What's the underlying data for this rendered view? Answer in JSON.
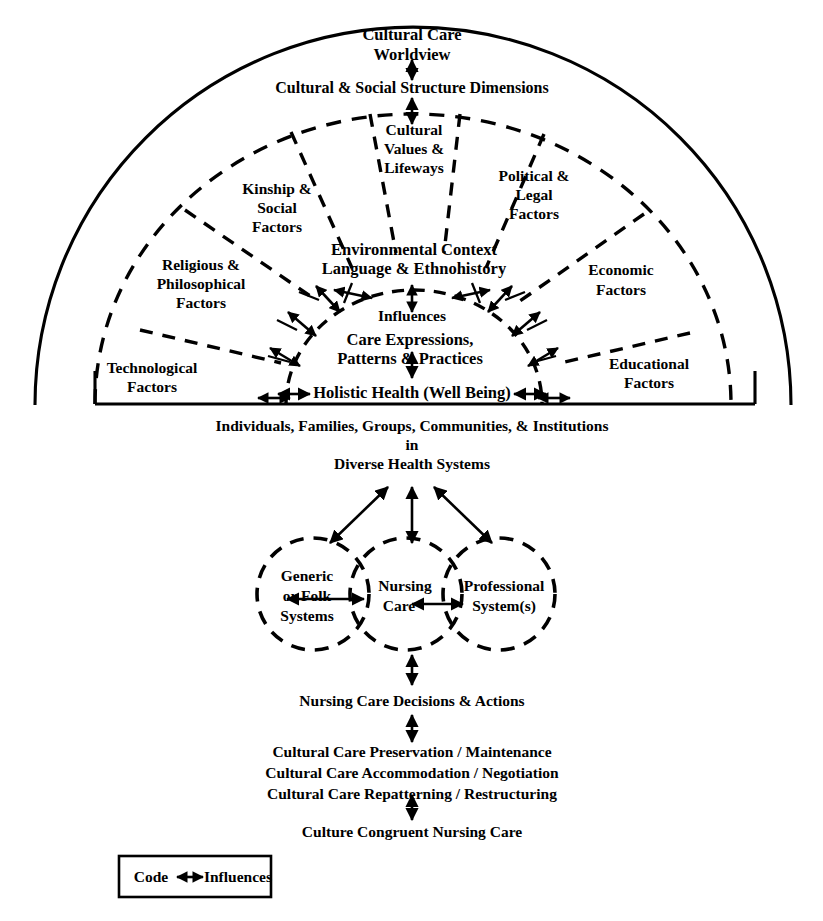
{
  "figure": {
    "title_top": "Cultural Care",
    "title_top2": "Worldview",
    "band_label": "Cultural & Social Structure Dimensions",
    "sectors": [
      {
        "id": "technological",
        "lines": [
          "Technological",
          "Factors"
        ]
      },
      {
        "id": "religious-philosophical",
        "lines": [
          "Religious &",
          "Philosophical",
          "Factors"
        ]
      },
      {
        "id": "kinship-social",
        "lines": [
          "Kinship &",
          "Social",
          "Factors"
        ]
      },
      {
        "id": "cultural-values",
        "lines": [
          "Cultural",
          "Values &",
          "Lifeways"
        ]
      },
      {
        "id": "political-legal",
        "lines": [
          "Political &",
          "Legal",
          "Factors"
        ]
      },
      {
        "id": "economic",
        "lines": [
          "Economic",
          "Factors"
        ]
      },
      {
        "id": "educational",
        "lines": [
          "Educational",
          "Factors"
        ]
      }
    ],
    "core": {
      "environment_line1": "Environmental Context",
      "environment_line2": "Language & Ethnohistory",
      "influences": "Influences",
      "care_line1": "Care Expressions,",
      "care_line2": "Patterns & Practices",
      "holistic": "Holistic Health (Well Being)"
    },
    "population": {
      "line1": "Individuals, Families, Groups, Communities, & Institutions",
      "line2": "in",
      "line3": "Diverse Health Systems"
    },
    "systems_circles": [
      {
        "id": "generic-folk",
        "lines": [
          "Generic",
          "or Folk",
          "Systems"
        ]
      },
      {
        "id": "nursing-care",
        "lines": [
          "Nursing",
          "Care"
        ]
      },
      {
        "id": "professional",
        "lines": [
          "Professional",
          "System(s)"
        ]
      }
    ],
    "decisions": "Nursing Care Decisions & Actions",
    "modes": [
      "Cultural Care Preservation / Maintenance",
      "Cultural Care Accommodation / Negotiation",
      "Cultural Care Repatterning / Restructuring"
    ],
    "outcome": "Culture Congruent Nursing Care",
    "legend": {
      "code_label": "Code",
      "influences_label": "Influences"
    },
    "colors": {
      "ink": "#000000",
      "background": "#ffffff"
    }
  }
}
